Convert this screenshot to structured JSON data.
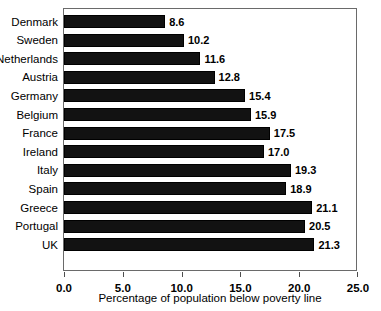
{
  "chart_data": {
    "type": "bar",
    "orientation": "horizontal",
    "title": "",
    "xlabel": "Percentage of population below poverty line",
    "ylabel": "",
    "categories": [
      "Denmark",
      "Sweden",
      "Netherlands",
      "Austria",
      "Germany",
      "Belgium",
      "France",
      "Ireland",
      "Italy",
      "Spain",
      "Greece",
      "Portugal",
      "UK"
    ],
    "values": [
      8.6,
      10.2,
      11.6,
      12.8,
      15.4,
      15.9,
      17.5,
      17.0,
      19.3,
      18.9,
      21.1,
      20.5,
      21.3
    ],
    "data_labels": [
      "8.6",
      "10.2",
      "11.6",
      "12.8",
      "15.4",
      "15.9",
      "17.5",
      "17.0",
      "19.3",
      "18.9",
      "21.1",
      "20.5",
      "21.3"
    ],
    "xlim": [
      0.0,
      25.0
    ],
    "xticks": [
      0.0,
      5.0,
      10.0,
      15.0,
      20.0,
      25.0
    ],
    "xtick_labels": [
      "0.0",
      "5.0",
      "10.0",
      "15.0",
      "20.0",
      "25.0"
    ],
    "grid": false,
    "legend": false,
    "bar_color": "#121212",
    "frame_color": "#6a6a6a",
    "background": "#ffffff"
  }
}
